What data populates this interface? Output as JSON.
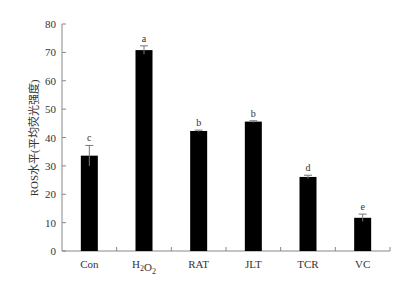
{
  "chart_data": {
    "type": "bar",
    "title": "",
    "xlabel": "",
    "ylabel": "ROS水平(平均荧光强度)",
    "ylim": [
      0,
      80
    ],
    "yticks": [
      0,
      10,
      20,
      30,
      40,
      50,
      60,
      70,
      80
    ],
    "grid": false,
    "legend": null,
    "categories": [
      "Con",
      "H2O2",
      "RAT",
      "JLT",
      "TCR",
      "VC"
    ],
    "category_display": [
      {
        "base": "Con",
        "sub1": "",
        "mid": "",
        "sub2": ""
      },
      {
        "base": "H",
        "sub1": "2",
        "mid": "O",
        "sub2": "2"
      },
      {
        "base": "RAT",
        "sub1": "",
        "mid": "",
        "sub2": ""
      },
      {
        "base": "JLT",
        "sub1": "",
        "mid": "",
        "sub2": ""
      },
      {
        "base": "TCR",
        "sub1": "",
        "mid": "",
        "sub2": ""
      },
      {
        "base": "VC",
        "sub1": "",
        "mid": "",
        "sub2": ""
      }
    ],
    "values": [
      33.6,
      70.8,
      42.3,
      45.6,
      26.1,
      11.7
    ],
    "errors": [
      3.6,
      1.5,
      0.3,
      0.3,
      0.6,
      1.3
    ],
    "significance": [
      "c",
      "a",
      "b",
      "b",
      "d",
      "e"
    ],
    "bar_color": "#000000"
  }
}
